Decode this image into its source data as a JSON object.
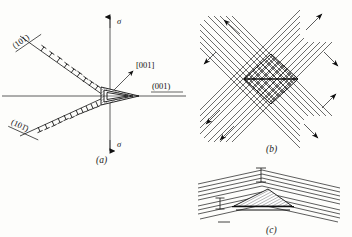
{
  "figure": {
    "background_color": "#fdfdfb",
    "ink_color": "#1a1a1a",
    "panels": [
      "a",
      "b",
      "c"
    ]
  },
  "panel_a": {
    "caption": "(a)",
    "description": "Dislocation pile-ups on intersecting slip planes nucleating a twin lamella at the origin under tensile stress sigma",
    "stress_label_top": "σ",
    "stress_label_bottom": "σ",
    "plane_label_upper_left": "(101)",
    "plane_label_lower_left": "(101̄)",
    "plane_label_right": "(001)",
    "direction_label": "[001]",
    "dislocation_count_upper": 9,
    "dislocation_count_lower": 11,
    "dislocation_symbol": "edge-dislocation-tee",
    "axis_vertical": "stress-axis",
    "axis_horizontal": "trace-axis"
  },
  "panel_b": {
    "caption": "(b)",
    "description": "Two intersecting sets of slip bands forming a rhombic intersection zone, each band set terminated by double-headed shear arrows",
    "band_set_count": 2,
    "bands_per_set": 11,
    "arrow_count": 8,
    "intersection_shape": "rhombus",
    "arrow_style": "solid-barbed"
  },
  "panel_c": {
    "caption": "(c)",
    "description": "Kinked lamellae with a hatched twin wedge nucleated at the kink apex",
    "lamella_count": 9,
    "wedge_shape": "hatched-triangle",
    "marker_symbol": "tee-marker",
    "marker_count": 3
  }
}
